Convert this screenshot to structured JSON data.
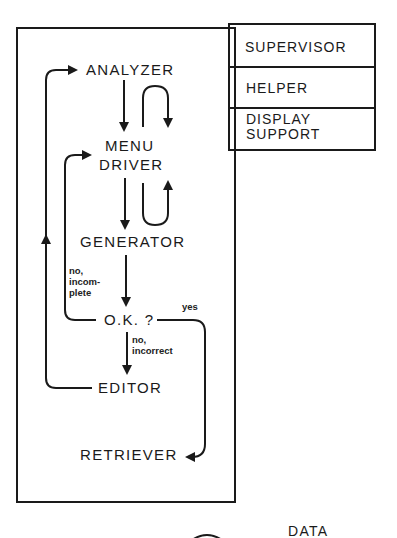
{
  "diagram": {
    "modules": {
      "supervisor": "SUPERVISOR",
      "helper": "HELPER",
      "display_support_1": "DISPLAY",
      "display_support_2": "SUPPORT"
    },
    "flow": {
      "analyzer": "ANALYZER",
      "menu_driver_1": "MENU",
      "menu_driver_2": "DRIVER",
      "generator": "GENERATOR",
      "ok_check": "O.K. ?",
      "editor": "EDITOR",
      "retriever": "RETRIEVER"
    },
    "edge_labels": {
      "no_incomplete_1": "no,",
      "no_incomplete_2": "incom-",
      "no_incomplete_3": "plete",
      "yes": "yes",
      "no_incorrect_1": "no,",
      "no_incorrect_2": "incorrect"
    },
    "data_label": "DATA"
  }
}
